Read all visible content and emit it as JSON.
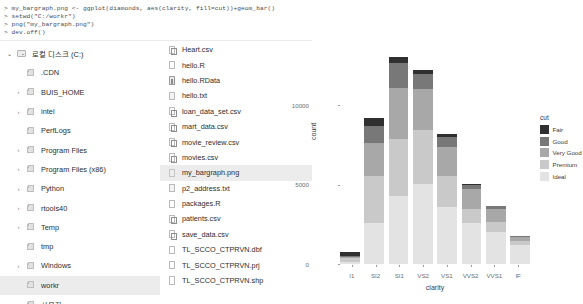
{
  "console": {
    "lines": [
      "> my_bargraph.png <- ggplot(diamonds, aes(clarity, fill=cut))+geom_bar()",
      "> setwd(\"C:/workr\")",
      "> png(\"my_bargraph.png\")",
      "> dev.off()"
    ]
  },
  "explorer": {
    "tree": [
      {
        "label": "로컬 디스크 (C:)",
        "icon": "drive-icon",
        "chevron": "⌄",
        "expanded": true,
        "level": 0,
        "selected": false
      },
      {
        "label": ".CDN",
        "icon": "folder-icon",
        "chevron": "",
        "expanded": false,
        "level": 1,
        "selected": false
      },
      {
        "label": "BUIS_HOME",
        "icon": "folder-icon",
        "chevron": "›",
        "expanded": false,
        "level": 1,
        "selected": false
      },
      {
        "label": "intel",
        "icon": "folder-icon",
        "chevron": "›",
        "expanded": false,
        "level": 1,
        "selected": false
      },
      {
        "label": "PerfLogs",
        "icon": "folder-icon",
        "chevron": "",
        "expanded": false,
        "level": 1,
        "selected": false
      },
      {
        "label": "Program Files",
        "icon": "folder-icon",
        "chevron": "›",
        "expanded": false,
        "level": 1,
        "selected": false
      },
      {
        "label": "Program Files (x86)",
        "icon": "folder-icon",
        "chevron": "›",
        "expanded": false,
        "level": 1,
        "selected": false
      },
      {
        "label": "Python",
        "icon": "folder-icon",
        "chevron": "›",
        "expanded": false,
        "level": 1,
        "selected": false
      },
      {
        "label": "rtools40",
        "icon": "folder-icon",
        "chevron": "›",
        "expanded": false,
        "level": 1,
        "selected": false
      },
      {
        "label": "Temp",
        "icon": "folder-icon",
        "chevron": "›",
        "expanded": false,
        "level": 1,
        "selected": false
      },
      {
        "label": "tmp",
        "icon": "folder-icon",
        "chevron": "",
        "expanded": false,
        "level": 1,
        "selected": false
      },
      {
        "label": "Windows",
        "icon": "folder-icon",
        "chevron": "›",
        "expanded": false,
        "level": 1,
        "selected": false
      },
      {
        "label": "workr",
        "icon": "folder-icon",
        "chevron": "",
        "expanded": false,
        "level": 1,
        "selected": true
      },
      {
        "label": "사용자",
        "icon": "folder-icon",
        "chevron": "›",
        "expanded": false,
        "level": 1,
        "selected": false
      }
    ],
    "files": [
      {
        "name": "Heart.csv",
        "icon": "csv-file-icon",
        "kind": "csv",
        "selected": false
      },
      {
        "name": "hello.R",
        "icon": "r-file-icon",
        "kind": "r",
        "selected": false
      },
      {
        "name": "hello.RData",
        "icon": "rdata-file-icon",
        "kind": "rdata",
        "selected": false
      },
      {
        "name": "hello.txt",
        "icon": "text-file-icon",
        "kind": "txt",
        "selected": false
      },
      {
        "name": "loan_data_set.csv",
        "icon": "csv-file-icon",
        "kind": "csv",
        "selected": false
      },
      {
        "name": "mart_data.csv",
        "icon": "csv-file-icon",
        "kind": "csv",
        "selected": false
      },
      {
        "name": "movie_review.csv",
        "icon": "csv-file-icon",
        "kind": "csv",
        "selected": false
      },
      {
        "name": "movies.csv",
        "icon": "csv-file-icon",
        "kind": "csv",
        "selected": false
      },
      {
        "name": "my_bargraph.png",
        "icon": "image-file-icon",
        "kind": "png",
        "selected": true
      },
      {
        "name": "p2_address.txt",
        "icon": "text-file-icon",
        "kind": "txt",
        "selected": false
      },
      {
        "name": "packages.R",
        "icon": "r-file-icon",
        "kind": "r",
        "selected": false
      },
      {
        "name": "patients.csv",
        "icon": "csv-file-icon",
        "kind": "csv",
        "selected": false
      },
      {
        "name": "save_data.csv",
        "icon": "csv-file-icon",
        "kind": "csv",
        "selected": false
      },
      {
        "name": "TL_SCCO_CTPRVN.dbf",
        "icon": "generic-file-icon",
        "kind": "r",
        "selected": false
      },
      {
        "name": "TL_SCCO_CTPRVN.prj",
        "icon": "generic-file-icon",
        "kind": "r",
        "selected": false
      },
      {
        "name": "TL_SCCO_CTPRVN.shp",
        "icon": "generic-file-icon",
        "kind": "r",
        "selected": false
      }
    ]
  },
  "chart_data": {
    "type": "bar",
    "stacked": true,
    "title": "",
    "xlabel": "clarity",
    "ylabel": "count",
    "categories": [
      "I1",
      "SI2",
      "SI1",
      "VS2",
      "VS1",
      "VVS2",
      "VVS1",
      "IF"
    ],
    "series": [
      {
        "name": "Ideal",
        "color": "#e3e3e3",
        "values": [
          146,
          2598,
          4282,
          5071,
          3589,
          2606,
          2047,
          1212
        ]
      },
      {
        "name": "Premium",
        "color": "#c9c9c9",
        "values": [
          205,
          2949,
          3575,
          3357,
          1989,
          870,
          616,
          230
        ]
      },
      {
        "name": "Very Good",
        "color": "#a8a8a8",
        "values": [
          84,
          2100,
          3240,
          2591,
          1775,
          1235,
          789,
          268
        ]
      },
      {
        "name": "Good",
        "color": "#787878",
        "values": [
          96,
          1081,
          1560,
          978,
          648,
          286,
          186,
          71
        ]
      },
      {
        "name": "Fair",
        "color": "#303030",
        "values": [
          210,
          466,
          408,
          261,
          170,
          69,
          17,
          9
        ]
      }
    ],
    "totals": [
      741,
      9194,
      13065,
      12258,
      8171,
      5066,
      3655,
      1790
    ],
    "ylim": [
      0,
      14000
    ],
    "yticks": [
      0,
      5000,
      10000
    ],
    "ytick_labels": [
      "0",
      "5000",
      "10000"
    ],
    "grid": false,
    "legend": {
      "title": "cut",
      "position": "right",
      "entries": [
        "Fair",
        "Good",
        "Very Good",
        "Premium",
        "Ideal"
      ]
    }
  }
}
